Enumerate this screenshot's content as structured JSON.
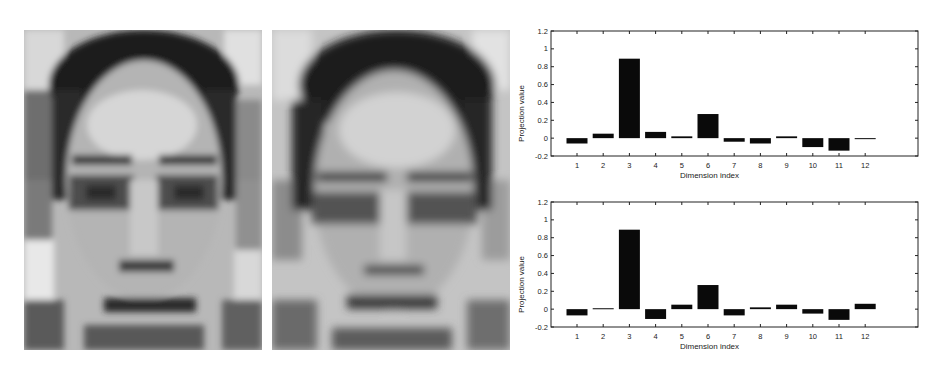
{
  "images": [
    {
      "label": "face-reconstruction-left",
      "description": "blocky grayscale reconstructed face"
    },
    {
      "label": "face-reconstruction-right",
      "description": "smoother grayscale reconstructed face"
    }
  ],
  "chart_data": [
    {
      "type": "bar",
      "title": "",
      "xlabel": "Dimension index",
      "ylabel": "Projection value",
      "categories": [
        "1",
        "2",
        "3",
        "4",
        "5",
        "6",
        "7",
        "8",
        "9",
        "10",
        "11",
        "12"
      ],
      "values": [
        -0.06,
        0.05,
        0.89,
        0.07,
        0.02,
        0.27,
        -0.04,
        -0.06,
        0.02,
        -0.1,
        -0.14,
        0.0
      ],
      "ylim": [
        -0.2,
        1.2
      ],
      "yticks": [
        "-0.2",
        "0",
        "0.2",
        "0.4",
        "0.6",
        "0.8",
        "1",
        "1.2"
      ],
      "grid": false,
      "legend": null
    },
    {
      "type": "bar",
      "title": "",
      "xlabel": "Dimension index",
      "ylabel": "Projection value",
      "categories": [
        "1",
        "2",
        "3",
        "4",
        "5",
        "6",
        "7",
        "8",
        "9",
        "10",
        "11",
        "12"
      ],
      "values": [
        -0.07,
        0.01,
        0.89,
        -0.11,
        0.05,
        0.27,
        -0.07,
        0.02,
        0.05,
        -0.05,
        -0.12,
        0.06
      ],
      "ylim": [
        -0.2,
        1.2
      ],
      "yticks": [
        "-0.2",
        "0",
        "0.2",
        "0.4",
        "0.6",
        "0.8",
        "1",
        "1.2"
      ],
      "grid": false,
      "legend": null
    }
  ]
}
